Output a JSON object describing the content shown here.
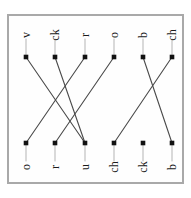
{
  "worksheet": {
    "title": "Matching exercise",
    "orientation_degrees": -90,
    "frame_color": "#a9a9a9",
    "line_color": "#4a4a4a",
    "node_color": "#111111",
    "background_color": "#ffffff",
    "top_row": {
      "name": "top-column",
      "items": [
        {
          "label": "v",
          "x": 26,
          "y": 57
        },
        {
          "label": "ck",
          "x": 55,
          "y": 57
        },
        {
          "label": "r",
          "x": 85,
          "y": 57
        },
        {
          "label": "o",
          "x": 114,
          "y": 57
        },
        {
          "label": "b",
          "x": 143,
          "y": 57
        },
        {
          "label": "ch",
          "x": 172,
          "y": 57
        }
      ],
      "label_offsets": {
        "dx": 0,
        "dy": -22
      },
      "stem_length": 18
    },
    "bottom_row": {
      "name": "bottom-column",
      "items": [
        {
          "label": "o",
          "x": 26,
          "y": 143
        },
        {
          "label": "r",
          "x": 55,
          "y": 143
        },
        {
          "label": "u",
          "x": 85,
          "y": 143
        },
        {
          "label": "ch",
          "x": 114,
          "y": 143
        },
        {
          "label": "ck",
          "x": 143,
          "y": 143
        },
        {
          "label": "b",
          "x": 172,
          "y": 143
        }
      ],
      "label_offsets": {
        "dx": 0,
        "dy": 24
      },
      "stem_length": 18
    },
    "connections": [
      {
        "from_top": 0,
        "to_bottom": 2,
        "from_label": "v",
        "to_label": "u"
      },
      {
        "from_top": 1,
        "to_bottom": 2,
        "from_label": "ck",
        "to_label": "u"
      },
      {
        "from_top": 2,
        "to_bottom": 0,
        "from_label": "r",
        "to_label": "o"
      },
      {
        "from_top": 3,
        "to_bottom": 1,
        "from_label": "o",
        "to_label": "r"
      },
      {
        "from_top": 4,
        "to_bottom": 5,
        "from_label": "b",
        "to_label": "b"
      },
      {
        "from_top": 5,
        "to_bottom": 3,
        "from_label": "ch",
        "to_label": "ch"
      }
    ]
  }
}
